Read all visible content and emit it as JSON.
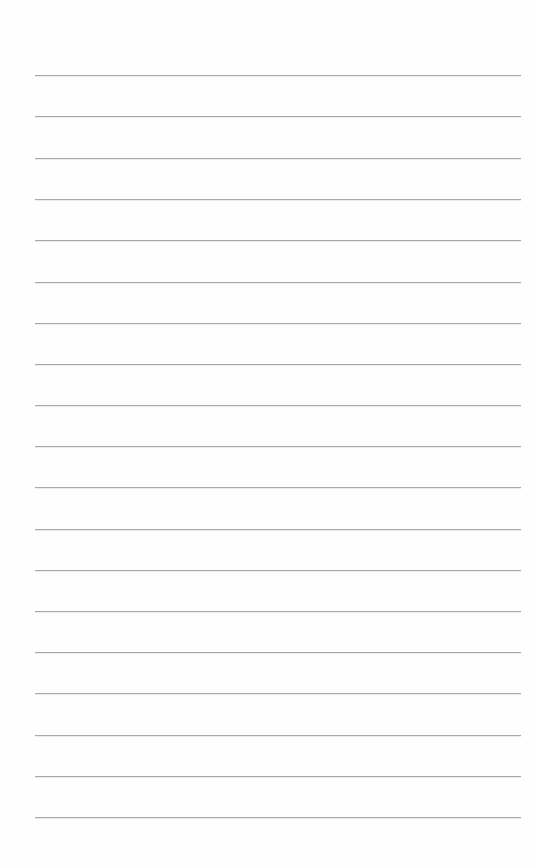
{
  "page": {
    "type": "lined-paper",
    "background_color": "#fefefe",
    "line_color": "#a9a9a9",
    "line_count": 19,
    "line_left": 35,
    "line_width": 486,
    "lines_y": [
      75,
      116,
      158,
      199,
      240,
      282,
      323,
      364,
      405,
      446,
      487,
      529,
      570,
      611,
      652,
      693,
      735,
      776,
      817
    ]
  }
}
